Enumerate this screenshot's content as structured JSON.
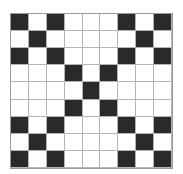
{
  "grid": {
    "rows": 9,
    "cols": 9,
    "colors": {
      "filled": "#2a2a2a",
      "empty": "#ffffff",
      "line": "#b5b5b5"
    },
    "cells": [
      [
        1,
        0,
        1,
        0,
        0,
        0,
        1,
        0,
        1
      ],
      [
        0,
        1,
        0,
        0,
        0,
        0,
        0,
        1,
        0
      ],
      [
        1,
        0,
        1,
        0,
        0,
        0,
        1,
        0,
        1
      ],
      [
        0,
        0,
        0,
        1,
        0,
        1,
        0,
        0,
        0
      ],
      [
        0,
        0,
        0,
        0,
        1,
        0,
        0,
        0,
        0
      ],
      [
        0,
        0,
        0,
        1,
        0,
        1,
        0,
        0,
        0
      ],
      [
        1,
        0,
        1,
        0,
        0,
        0,
        1,
        0,
        1
      ],
      [
        0,
        1,
        0,
        0,
        0,
        0,
        0,
        1,
        0
      ],
      [
        1,
        0,
        1,
        0,
        0,
        0,
        1,
        0,
        1
      ]
    ]
  }
}
